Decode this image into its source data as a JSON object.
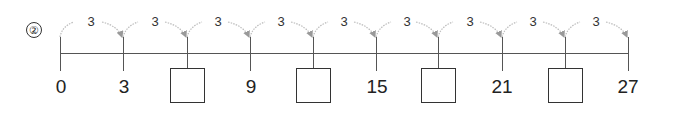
{
  "problem": {
    "number_label": "②"
  },
  "number_line": {
    "start": 0,
    "end": 27,
    "step": 3,
    "ticks": [
      {
        "value": "0",
        "x": 60,
        "blank": false
      },
      {
        "value": "3",
        "x": 123,
        "blank": false
      },
      {
        "value": "",
        "x": 187,
        "blank": true
      },
      {
        "value": "9",
        "x": 250,
        "blank": false
      },
      {
        "value": "",
        "x": 313,
        "blank": true
      },
      {
        "value": "15",
        "x": 376,
        "blank": false
      },
      {
        "value": "",
        "x": 438,
        "blank": true
      },
      {
        "value": "21",
        "x": 502,
        "blank": false
      },
      {
        "value": "",
        "x": 565,
        "blank": true
      },
      {
        "value": "27",
        "x": 628,
        "blank": false
      }
    ],
    "jumps": [
      {
        "label": "3"
      },
      {
        "label": "3"
      },
      {
        "label": "3"
      },
      {
        "label": "3"
      },
      {
        "label": "3"
      },
      {
        "label": "3"
      },
      {
        "label": "3"
      },
      {
        "label": "3"
      },
      {
        "label": "3"
      }
    ],
    "colors": {
      "line": "#555555",
      "arc": "#aaaaaa",
      "text": "#222222"
    }
  },
  "labels": {
    "t0": "0",
    "t1": "3",
    "t3": "9",
    "t5": "15",
    "t7": "21",
    "t9": "27",
    "j0": "3",
    "j1": "3",
    "j2": "3",
    "j3": "3",
    "j4": "3",
    "j5": "3",
    "j6": "3",
    "j7": "3",
    "j8": "3"
  }
}
